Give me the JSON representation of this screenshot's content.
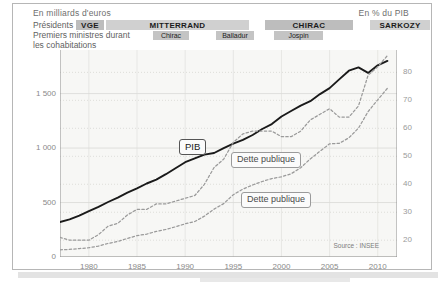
{
  "figure": {
    "header_left": "En milliards d'euros",
    "header_right": "En % du PIB",
    "row_labels": {
      "presidents": "Présidents",
      "prime_ministers": "Premiers ministres durant",
      "cohabitations": "les cohabitations"
    },
    "source": "Source : INSEE"
  },
  "presidents": [
    {
      "name": "VGE",
      "x": 63,
      "w": 28
    },
    {
      "name": "MITTERRAND",
      "x": 93,
      "w": 143
    },
    {
      "name": "CHIRAC",
      "x": 252,
      "w": 88
    },
    {
      "name": "SARKOZY",
      "x": 357,
      "w": 60
    }
  ],
  "prime_ministers": [
    {
      "name": "Chirac",
      "x": 140,
      "w": 36
    },
    {
      "name": "Balladur",
      "x": 203,
      "w": 38
    },
    {
      "name": "Jospin",
      "x": 261,
      "w": 49
    }
  ],
  "callouts": [
    {
      "id": "pib",
      "text": "PIB",
      "x": 166,
      "y": 135,
      "style": "dark"
    },
    {
      "id": "dette_pct",
      "text": "Dette publique",
      "x": 218,
      "y": 148,
      "style": "light"
    },
    {
      "id": "dette_mds",
      "text": "Dette publique",
      "x": 228,
      "y": 188,
      "style": "light"
    }
  ],
  "chart_data": {
    "type": "line",
    "xlabel": "",
    "ylabel": "En milliards d'euros",
    "y2label": "En % du PIB",
    "xlim": [
      1977,
      2012
    ],
    "ylim": [
      0,
      1900
    ],
    "y2lim": [
      14,
      88
    ],
    "grid": true,
    "legend": "annotations",
    "xticks": [
      1980,
      1985,
      1990,
      1995,
      2000,
      2005,
      2010
    ],
    "yticks": [
      0,
      500,
      "1 000",
      "1 500"
    ],
    "yticks_values": [
      0,
      500,
      1000,
      1500
    ],
    "y2ticks": [
      20,
      30,
      40,
      50,
      60,
      70,
      80
    ],
    "series": [
      {
        "name": "PIB",
        "axis": "left",
        "style": "solid",
        "color": "#1a1a1a",
        "unit": "milliards d'euros",
        "x": [
          1977,
          1978,
          1979,
          1980,
          1981,
          1982,
          1983,
          1984,
          1985,
          1986,
          1987,
          1988,
          1989,
          1990,
          1991,
          1992,
          1993,
          1994,
          1995,
          1996,
          1997,
          1998,
          1999,
          2000,
          2001,
          2002,
          2003,
          2004,
          2005,
          2006,
          2007,
          2008,
          2009,
          2010,
          2011
        ],
        "values": [
          320,
          345,
          380,
          420,
          460,
          505,
          545,
          590,
          630,
          675,
          710,
          760,
          815,
          870,
          905,
          940,
          955,
          1000,
          1040,
          1075,
          1120,
          1175,
          1220,
          1290,
          1340,
          1390,
          1430,
          1495,
          1550,
          1630,
          1710,
          1740,
          1690,
          1760,
          1800
        ]
      },
      {
        "name": "Dette publique (% du PIB)",
        "axis": "right",
        "style": "dashed",
        "color": "#9a9a9a",
        "unit": "% du PIB",
        "x": [
          1977,
          1978,
          1979,
          1980,
          1981,
          1982,
          1983,
          1984,
          1985,
          1986,
          1987,
          1988,
          1989,
          1990,
          1991,
          1992,
          1993,
          1994,
          1995,
          1996,
          1997,
          1998,
          1999,
          2000,
          2001,
          2002,
          2003,
          2004,
          2005,
          2006,
          2007,
          2008,
          2009,
          2010,
          2011
        ],
        "values": [
          21,
          20,
          20,
          20,
          22,
          25,
          26,
          29,
          31,
          31,
          33,
          33,
          34,
          35,
          36,
          40,
          46,
          49,
          55,
          58,
          59,
          59,
          59,
          57,
          57,
          59,
          63,
          65,
          67,
          64,
          64,
          68,
          79,
          82,
          86
        ]
      },
      {
        "name": "Dette publique (milliards d'euros)",
        "axis": "left",
        "style": "dashed",
        "color": "#9a9a9a",
        "unit": "milliards d'euros",
        "x": [
          1977,
          1978,
          1979,
          1980,
          1981,
          1982,
          1983,
          1984,
          1985,
          1986,
          1987,
          1988,
          1989,
          1990,
          1991,
          1992,
          1993,
          1994,
          1995,
          1996,
          1997,
          1998,
          1999,
          2000,
          2001,
          2002,
          2003,
          2004,
          2005,
          2006,
          2007,
          2008,
          2009,
          2010,
          2011
        ],
        "values": [
          66,
          70,
          77,
          85,
          100,
          125,
          143,
          170,
          196,
          210,
          235,
          252,
          277,
          305,
          326,
          375,
          440,
          490,
          572,
          623,
          661,
          693,
          720,
          736,
          764,
          820,
          900,
          971,
          1039,
          1043,
          1094,
          1183,
          1335,
          1443,
          1548
        ]
      }
    ]
  }
}
